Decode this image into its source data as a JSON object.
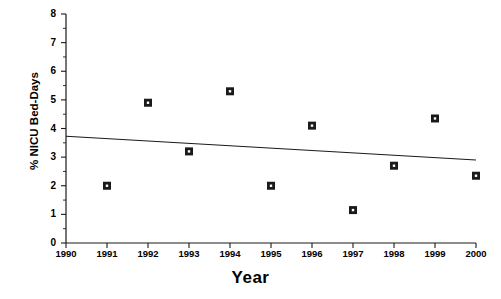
{
  "chart_data": {
    "type": "scatter",
    "title": "",
    "xlabel": "Year",
    "ylabel": "% NICU Bed-Days",
    "xlim": [
      1990,
      2000
    ],
    "ylim": [
      0,
      8
    ],
    "grid": false,
    "legend": null,
    "x_ticks": [
      1990,
      1991,
      1992,
      1993,
      1994,
      1995,
      1996,
      1997,
      1998,
      1999,
      2000
    ],
    "x_tick_labels": [
      "1990",
      "1991",
      "1992",
      "1993",
      "1994",
      "1995",
      "1996",
      "1997",
      "1998",
      "1999",
      "2000"
    ],
    "y_ticks": [
      0,
      1,
      2,
      3,
      4,
      5,
      6,
      7,
      8
    ],
    "y_tick_labels": [
      "0",
      "1",
      "2",
      "3",
      "4",
      "5",
      "6",
      "7",
      "8"
    ],
    "y_minor_ticks": [
      0.5,
      1.5,
      2.5,
      3.5,
      4.5,
      5.5,
      6.5,
      7.5
    ],
    "marker_style": "filled-square-with-white-center",
    "marker_color": "#1a1a1a",
    "series": [
      {
        "name": "% NICU Bed-Days",
        "x": [
          1991,
          1992,
          1993,
          1994,
          1995,
          1996,
          1997,
          1998,
          1999,
          2000
        ],
        "values": [
          2.0,
          4.9,
          3.2,
          5.3,
          2.0,
          4.1,
          1.15,
          2.7,
          4.35,
          2.35
        ]
      }
    ],
    "trend_line": {
      "name": "linear-regression",
      "x_start": 1990,
      "y_start": 3.73,
      "x_end": 2000,
      "y_end": 2.9,
      "color": "#1a1a1a"
    }
  }
}
